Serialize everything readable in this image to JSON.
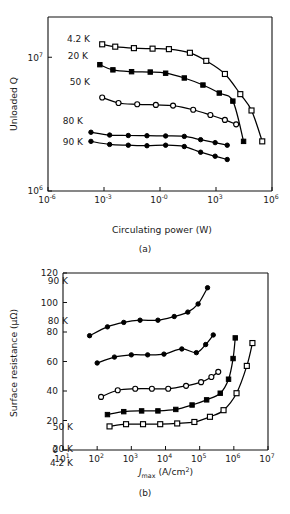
{
  "figure": {
    "background": "#ffffff",
    "ink": "#000000"
  },
  "panel_a": {
    "caption": "(a)",
    "xlabel": "Circulating power (W)",
    "ylabel": "Unloaded Q",
    "xticks": [
      "10",
      "10",
      "10",
      "10",
      "10"
    ],
    "xtick_exps": [
      "-6",
      "-3",
      "-0",
      "3",
      "6"
    ],
    "yticks": [
      "10",
      "10"
    ],
    "ytick_exps": [
      "7",
      "6"
    ],
    "labels": {
      "s1": "4.2 K",
      "s2": "20 K",
      "s3": "50 K",
      "s4": "80 K",
      "s5": "90 K"
    }
  },
  "panel_b": {
    "caption": "(b)",
    "xlabel_main": "J",
    "xlabel_sub": "max",
    "xlabel_rest": " (A/cm",
    "xlabel_sup": "2",
    "xlabel_close": ")",
    "ylabel": "Surface resistance (μΩ)",
    "xticks": [
      "10",
      "10",
      "10",
      "10",
      "10",
      "10",
      "10"
    ],
    "xtick_exps": [
      "1",
      "2",
      "3",
      "4",
      "5",
      "6",
      "7"
    ],
    "yticks": [
      "0",
      "20",
      "40",
      "60",
      "80",
      "100",
      "120"
    ],
    "labels": {
      "s1": "90 K",
      "s2": "80 K",
      "s3": "50 K",
      "s4": "20 K",
      "s5": "4.2 K"
    }
  },
  "chart_data": [
    {
      "type": "line",
      "id": "panel-a",
      "title": "",
      "caption": "(a)",
      "xlabel": "Circulating power (W)",
      "ylabel": "Unloaded Q",
      "xscale": "log",
      "yscale": "log",
      "xlim": [
        1e-06,
        1000000.0
      ],
      "ylim": [
        1000000,
        20000000
      ],
      "xticks": [
        1e-06,
        0.001,
        1,
        1000,
        1000000
      ],
      "yticks": [
        10000000,
        1000000
      ],
      "grid": false,
      "legend_position": "inline-left",
      "series": [
        {
          "name": "4.2 K",
          "marker": "open-square",
          "x": [
            0.0008,
            0.004,
            0.04,
            0.4,
            3,
            40,
            300,
            3000,
            20000,
            80000,
            300000
          ],
          "y": [
            12500000,
            12000000,
            11700000,
            11600000,
            11500000,
            10800000,
            9400000,
            7500000,
            5300000,
            4000000,
            2350000
          ]
        },
        {
          "name": "20 K",
          "marker": "filled-square",
          "x": [
            0.0006,
            0.003,
            0.03,
            0.3,
            2,
            20,
            200,
            1500,
            8000,
            30000
          ],
          "y": [
            8800000,
            8050000,
            7800000,
            7750000,
            7600000,
            7000000,
            6200000,
            5400000,
            4700000,
            2350000
          ]
        },
        {
          "name": "50 K",
          "marker": "open-circle",
          "x": [
            0.0008,
            0.006,
            0.06,
            0.6,
            5,
            60,
            500,
            3000,
            12000
          ],
          "y": [
            5000000,
            4550000,
            4450000,
            4400000,
            4350000,
            4050000,
            3700000,
            3400000,
            3150000
          ]
        },
        {
          "name": "80 K",
          "marker": "filled-circle",
          "x": [
            0.0002,
            0.002,
            0.02,
            0.2,
            2,
            20,
            150,
            900,
            4000
          ],
          "y": [
            2750000,
            2620000,
            2600000,
            2590000,
            2580000,
            2560000,
            2420000,
            2300000,
            2200000
          ]
        },
        {
          "name": "90 K",
          "marker": "filled-circle",
          "x": [
            0.0002,
            0.002,
            0.02,
            0.2,
            2,
            20,
            150,
            900,
            4000
          ],
          "y": [
            2350000,
            2230000,
            2200000,
            2180000,
            2200000,
            2150000,
            1950000,
            1820000,
            1720000
          ]
        }
      ]
    },
    {
      "type": "line",
      "id": "panel-b",
      "title": "",
      "caption": "(b)",
      "xlabel": "Jmax (A/cm2)",
      "ylabel": "Surface resistance (μΩ)",
      "xscale": "log",
      "yscale": "linear",
      "xlim": [
        10,
        10000000
      ],
      "ylim": [
        0,
        120
      ],
      "xticks": [
        10,
        100,
        1000,
        10000,
        100000,
        1000000,
        10000000
      ],
      "yticks": [
        0,
        20,
        40,
        60,
        80,
        100,
        120
      ],
      "grid": false,
      "legend_position": "inline-left",
      "series": [
        {
          "name": "90 K",
          "marker": "filled-circle",
          "x": [
            60,
            200,
            600,
            1800,
            6000,
            18000,
            45000,
            90000,
            170000
          ],
          "y": [
            77.5,
            83.5,
            86.5,
            88,
            88,
            90.5,
            93.5,
            99,
            110
          ]
        },
        {
          "name": "80 K",
          "marker": "filled-circle",
          "x": [
            100,
            320,
            1000,
            3000,
            9000,
            30000,
            80000,
            150000,
            250000
          ],
          "y": [
            59,
            63,
            64.5,
            64.5,
            65,
            68.5,
            66,
            71.5,
            78
          ]
        },
        {
          "name": "50 K",
          "marker": "open-circle",
          "x": [
            130,
            400,
            1300,
            4000,
            12000,
            40000,
            110000,
            220000,
            350000
          ],
          "y": [
            36,
            40.5,
            41.5,
            41.5,
            41.5,
            43.5,
            46,
            49.5,
            53
          ]
        },
        {
          "name": "20 K",
          "marker": "filled-square",
          "x": [
            200,
            600,
            2000,
            6000,
            20000,
            60000,
            160000,
            400000,
            700000,
            950000,
            1100000
          ],
          "y": [
            24,
            26,
            26.5,
            26.5,
            27.5,
            30.5,
            34,
            38.5,
            48,
            62,
            76
          ]
        },
        {
          "name": "4.2 K",
          "marker": "open-square",
          "x": [
            230,
            700,
            2200,
            7000,
            22000,
            70000,
            200000,
            500000,
            1200000,
            2400000,
            3500000
          ],
          "y": [
            16,
            17.5,
            17.5,
            17.5,
            18,
            19,
            22.5,
            27,
            38.5,
            57,
            72.5
          ]
        }
      ]
    }
  ]
}
